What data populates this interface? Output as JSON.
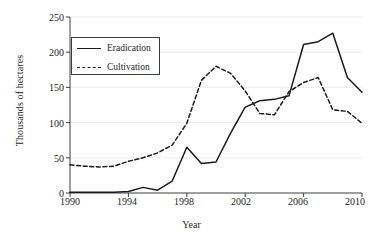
{
  "chart_data": {
    "type": "line",
    "title": "",
    "xlabel": "Year",
    "ylabel": "Thousands of hectares",
    "xlim": [
      1990,
      2010
    ],
    "ylim": [
      0,
      250
    ],
    "xticks": [
      1990,
      1994,
      1998,
      2002,
      2006,
      2010
    ],
    "yticks": [
      0,
      50,
      100,
      150,
      200,
      250
    ],
    "grid": "horizontal",
    "legend_position": "upper-left-inside",
    "x": [
      1990,
      1991,
      1992,
      1993,
      1994,
      1995,
      1996,
      1997,
      1998,
      1999,
      2000,
      2001,
      2002,
      2003,
      2004,
      2005,
      2006,
      2007,
      2008,
      2009,
      2010
    ],
    "series": [
      {
        "name": "Eradication",
        "style": "solid",
        "color": "#1a1a1a",
        "values": [
          1,
          1,
          1,
          1,
          2,
          8,
          4,
          17,
          65,
          42,
          44,
          85,
          122,
          131,
          133,
          138,
          211,
          215,
          227,
          164,
          143
        ]
      },
      {
        "name": "Cultivation",
        "style": "dashed",
        "color": "#1a1a1a",
        "values": [
          40,
          38,
          37,
          38,
          45,
          50,
          57,
          68,
          99,
          160,
          180,
          170,
          145,
          113,
          111,
          144,
          157,
          164,
          118,
          116,
          99
        ]
      }
    ]
  },
  "axis": {
    "x_tick_labels": [
      "1990",
      "1994",
      "1998",
      "2002",
      "2006",
      "2010"
    ],
    "y_tick_labels": [
      "0",
      "50",
      "100",
      "150",
      "200",
      "250"
    ],
    "x_title": "Year",
    "y_title": "Thousands of hectares"
  },
  "legend": {
    "items": [
      {
        "label": "Eradication",
        "style": "solid"
      },
      {
        "label": "Cultivation",
        "style": "dashed"
      }
    ]
  }
}
